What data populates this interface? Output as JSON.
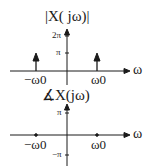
{
  "magnitude_plot": {
    "title": "|X( jω)|",
    "y_ticks": [
      "2π",
      "π"
    ],
    "x_ticks": [
      "−ω0",
      "ω0"
    ],
    "x_axis_label": "ω",
    "impulses": [
      {
        "at": "−ω0",
        "height": "π"
      },
      {
        "at": "ω0",
        "height": "π"
      }
    ]
  },
  "phase_plot": {
    "title": "∡X(jω)",
    "y_ticks": [
      "π",
      "−π"
    ],
    "x_ticks": [
      "−ω0",
      "ω0"
    ],
    "x_axis_label": "ω",
    "value": "0"
  },
  "colors": {
    "ink": "#1a1a1a",
    "background": "#ffffff"
  }
}
